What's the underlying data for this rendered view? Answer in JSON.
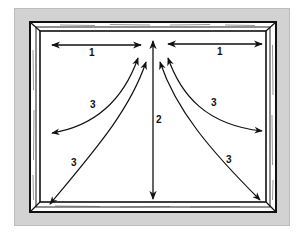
{
  "diagram": {
    "colors": {
      "panel_background": "#d2d2d2",
      "frame_fill": "#ffffff",
      "line": "#111111"
    },
    "arrows": [
      {
        "id": "arrow-1-left",
        "label": "1",
        "type": "double-headed horizontal"
      },
      {
        "id": "arrow-1-right",
        "label": "1",
        "type": "double-headed horizontal"
      },
      {
        "id": "arrow-2-center",
        "label": "2",
        "type": "double-headed vertical"
      },
      {
        "id": "arrow-3-left-inner",
        "label": "3",
        "type": "double-headed curved"
      },
      {
        "id": "arrow-3-left-outer",
        "label": "3",
        "type": "double-headed curved"
      },
      {
        "id": "arrow-3-right-inner",
        "label": "3",
        "type": "double-headed curved"
      },
      {
        "id": "arrow-3-right-outer",
        "label": "3",
        "type": "double-headed curved"
      }
    ],
    "labels": {
      "one_left": "1",
      "one_right": "1",
      "two": "2",
      "three_left_inner": "3",
      "three_left_outer": "3",
      "three_right_inner": "3",
      "three_right_outer": "3"
    }
  }
}
